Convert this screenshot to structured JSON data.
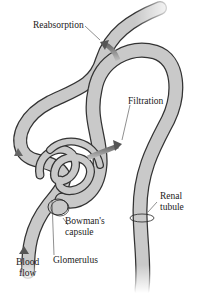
{
  "labels": {
    "reabsorption": "Reabsorption",
    "filtration": "Filtration",
    "renal_tubule_line1": "Renal",
    "renal_tubule_line2": "tubule",
    "bowmans_line1": "Bowman's",
    "bowmans_line2": "capsule",
    "glomerulus": "Glomerulus",
    "blood_flow_line1": "Blood",
    "blood_flow_line2": "flow"
  },
  "colors": {
    "tube_fill": "#c9c9c9",
    "tube_outline": "#333333",
    "arrow_fill": "#8a8a8a",
    "background": "#ffffff"
  }
}
